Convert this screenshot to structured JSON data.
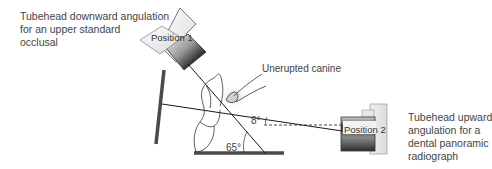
{
  "captions": {
    "position1": {
      "lines": [
        "Tubehead downward angulation",
        "for an upper standard",
        "occlusal"
      ]
    },
    "position2": {
      "lines": [
        "Tubehead upward",
        "angulation for a",
        "dental panoramic",
        "radiograph"
      ]
    }
  },
  "labels": {
    "unerupted_canine": "Unerupted canine",
    "position1": "Position 1",
    "position2": "Position 2",
    "angle_small": "8°",
    "angle_large": "65°"
  },
  "angles": {
    "upward_beam_deg": 8,
    "downward_beam_deg": 65
  },
  "colors": {
    "line": "#1a1a1a",
    "film": "#4a4a4a",
    "text": "#444444",
    "tooth_outline": "#333333",
    "canine_shade": "#c8c8c8"
  }
}
